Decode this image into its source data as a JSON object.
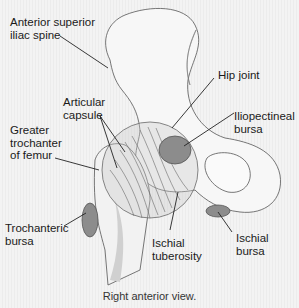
{
  "diagram": {
    "labels": {
      "anterior_superior_iliac_spine": "Anterior superior\niliac spine",
      "articular_capsule": "Articular\ncapsule",
      "greater_trochanter": "Greater\ntrochanter\nof femur",
      "trochanteric_bursa": "Trochanteric\nbursa",
      "hip_joint": "Hip joint",
      "iliopectineal_bursa": "Iliopectineal\nbursa",
      "ischial_tuberosity": "Ischial\ntuberosity",
      "ischial_bursa": "Ischial\nbursa"
    },
    "caption": "Right anterior view.",
    "colors": {
      "bone": "#f7f7f7",
      "bone_shadow": "#d6d6d6",
      "bursa": "#8c8c8c",
      "capsule": "#a9a9a9",
      "line": "#222222"
    }
  }
}
